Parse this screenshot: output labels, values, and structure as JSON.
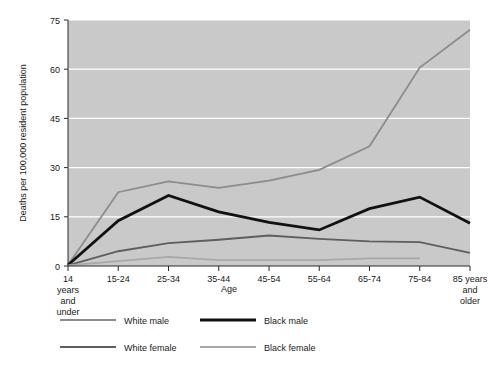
{
  "chart_data": {
    "type": "line",
    "title": "",
    "xlabel": "Age",
    "ylabel": "Deaths per 100,000 resident population",
    "categories": [
      "14 years and under",
      "15-24",
      "25-34",
      "35-44",
      "45-54",
      "55-64",
      "65-74",
      "75-84",
      "85 years and older"
    ],
    "category_lines": [
      [
        "14",
        "years",
        "and",
        "under"
      ],
      [
        "15-24"
      ],
      [
        "25-34"
      ],
      [
        "35-44"
      ],
      [
        "45-54"
      ],
      [
        "55-64"
      ],
      [
        "65-74"
      ],
      [
        "75-84"
      ],
      [
        "85 years",
        "and",
        "older"
      ]
    ],
    "ylim": [
      0,
      75
    ],
    "yticks": [
      0,
      15,
      30,
      45,
      60,
      75
    ],
    "ytick_labels": [
      "0",
      "15",
      "30",
      "45",
      "60",
      "75"
    ],
    "grid": "horizontal",
    "legend_position": "bottom",
    "plot_background": "#c9c9c9",
    "series": [
      {
        "name": "White male",
        "color": "#8c8c8c",
        "width": 1.8,
        "values": [
          0.3,
          22.5,
          25.8,
          23.8,
          26.0,
          29.3,
          36.5,
          60.5,
          72.0
        ]
      },
      {
        "name": "Black male",
        "color": "#111111",
        "width": 2.8,
        "values": [
          0.3,
          13.8,
          21.5,
          16.5,
          13.3,
          11.0,
          17.5,
          21.0,
          13.0
        ]
      },
      {
        "name": "White female",
        "color": "#5e5e5e",
        "width": 1.8,
        "values": [
          0.2,
          4.5,
          7.0,
          8.0,
          9.3,
          8.3,
          7.5,
          7.3,
          4.0
        ]
      },
      {
        "name": "Black female",
        "color": "#a8a8a8",
        "width": 1.8,
        "values": [
          0.2,
          1.5,
          2.8,
          1.8,
          1.8,
          1.8,
          2.3,
          2.3,
          null
        ]
      }
    ]
  },
  "legend": {
    "items": [
      {
        "label": "White male",
        "color": "#8c8c8c",
        "width": 1.8
      },
      {
        "label": "Black male",
        "color": "#111111",
        "width": 2.8
      },
      {
        "label": "White female",
        "color": "#5e5e5e",
        "width": 1.8
      },
      {
        "label": "Black female",
        "color": "#a8a8a8",
        "width": 1.8
      }
    ]
  }
}
